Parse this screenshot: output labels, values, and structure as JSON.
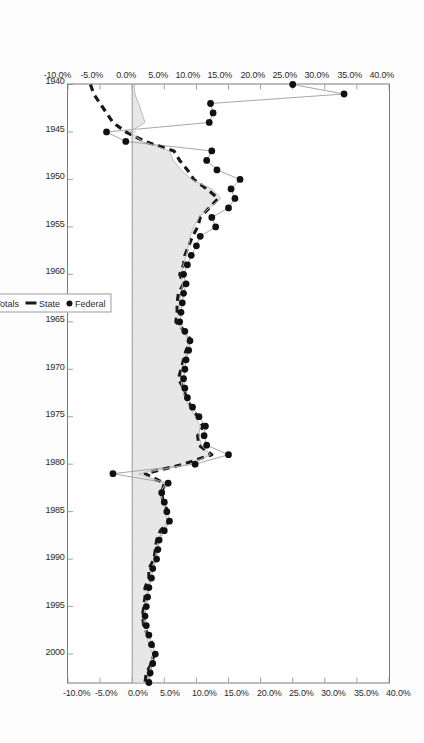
{
  "chart_data": {
    "type": "area",
    "title": "",
    "subtitle": "",
    "xlabel": "",
    "ylabel": "",
    "orientation": "rotated-90-clockwise",
    "grid": false,
    "legend_position": "right-of-plot",
    "xlim": [
      1940,
      2003
    ],
    "ylim": [
      -10.0,
      40.0
    ],
    "y_tick_labels": [
      "40.0%",
      "35.0%",
      "30.0%",
      "25.0%",
      "20.0%",
      "15.0%",
      "10.0%",
      "5.0%",
      "0.0%",
      "-5.0%",
      "-10.0%"
    ],
    "y_tick_values": [
      40.0,
      35.0,
      30.0,
      25.0,
      20.0,
      15.0,
      10.0,
      5.0,
      0.0,
      -5.0,
      -10.0
    ],
    "y_axis_duplicated": true,
    "x_tick_labels": [
      "1940",
      "1945",
      "1950",
      "1955",
      "1960",
      "1965",
      "1970",
      "1975",
      "1980",
      "1985",
      "1990",
      "1995",
      "2000"
    ],
    "x_tick_values": [
      1940,
      1945,
      1950,
      1955,
      1960,
      1965,
      1970,
      1975,
      1980,
      1985,
      1990,
      1995,
      2000
    ],
    "x": [
      1940,
      1941,
      1942,
      1943,
      1944,
      1945,
      1946,
      1947,
      1948,
      1949,
      1950,
      1951,
      1952,
      1953,
      1954,
      1955,
      1956,
      1957,
      1958,
      1959,
      1960,
      1961,
      1962,
      1963,
      1964,
      1965,
      1966,
      1967,
      1968,
      1969,
      1970,
      1971,
      1972,
      1973,
      1974,
      1975,
      1976,
      1977,
      1978,
      1979,
      1980,
      1981,
      1982,
      1983,
      1984,
      1985,
      1986,
      1987,
      1988,
      1989,
      1990,
      1991,
      1992,
      1993,
      1994,
      1995,
      1996,
      1997,
      1998,
      1999,
      2000,
      2001,
      2002,
      2003
    ],
    "series": [
      {
        "name": "Totals",
        "style": "filled-area-light-gray",
        "color": "#e6e6e6",
        "values": [
          0.3,
          0.4,
          1.0,
          1.5,
          2.0,
          -0.4,
          1.6,
          5.8,
          6.4,
          7.6,
          9.2,
          12.4,
          13.8,
          12.0,
          10.4,
          9.6,
          9.0,
          8.8,
          8.4,
          8.0,
          7.6,
          7.9,
          7.6,
          7.4,
          7.2,
          7.0,
          8.0,
          8.8,
          8.6,
          8.2,
          7.8,
          7.6,
          7.8,
          8.2,
          9.0,
          9.8,
          10.6,
          10.4,
          10.8,
          12.2,
          9.0,
          1.0,
          5.2,
          4.4,
          4.8,
          5.2,
          5.4,
          4.8,
          4.0,
          3.8,
          3.6,
          3.0,
          2.8,
          2.4,
          2.2,
          2.0,
          1.8,
          1.9,
          2.2,
          2.6,
          3.2,
          3.0,
          2.6,
          2.4
        ]
      },
      {
        "name": "State",
        "style": "dashed-line",
        "color": "#1a1a1a",
        "values": [
          -6.5,
          -6.0,
          -5.0,
          -4.0,
          -3.0,
          -1.0,
          2.0,
          6.5,
          7.4,
          8.6,
          9.6,
          11.6,
          13.4,
          12.0,
          10.6,
          10.2,
          9.4,
          8.8,
          8.2,
          8.0,
          7.4,
          8.0,
          7.2,
          7.0,
          7.0,
          6.8,
          8.2,
          9.2,
          8.4,
          8.0,
          7.6,
          7.2,
          8.0,
          8.4,
          9.2,
          10.2,
          11.0,
          10.2,
          10.4,
          12.4,
          8.0,
          2.0,
          5.0,
          4.6,
          4.8,
          5.6,
          5.8,
          4.4,
          3.8,
          3.6,
          3.4,
          2.6,
          2.6,
          2.0,
          2.0,
          1.8,
          1.6,
          1.8,
          2.4,
          3.2,
          3.4,
          3.0,
          2.2,
          2.0
        ]
      },
      {
        "name": "Federal",
        "style": "markers-dots-thin-line",
        "color": "#111111",
        "values": [
          25.0,
          33.0,
          12.2,
          12.6,
          12.0,
          -4.0,
          -1.0,
          12.4,
          11.6,
          13.2,
          16.8,
          15.4,
          16.0,
          15.0,
          12.4,
          13.0,
          10.6,
          10.0,
          9.2,
          8.6,
          8.0,
          8.4,
          8.0,
          7.8,
          7.6,
          7.4,
          8.2,
          9.0,
          8.8,
          8.4,
          8.2,
          8.0,
          8.2,
          8.6,
          9.4,
          10.4,
          11.4,
          11.2,
          11.6,
          15.0,
          9.8,
          -3.0,
          5.6,
          4.6,
          5.0,
          5.4,
          5.8,
          5.0,
          4.2,
          4.0,
          3.8,
          3.2,
          3.0,
          2.6,
          2.4,
          2.2,
          2.0,
          2.2,
          2.6,
          3.0,
          3.6,
          3.2,
          2.8,
          2.6
        ]
      }
    ]
  },
  "legend": {
    "items": [
      {
        "label": "Totals",
        "swatch": "area-swatch"
      },
      {
        "label": "State",
        "swatch": "dash-swatch"
      },
      {
        "label": "Federal",
        "swatch": "dot-swatch"
      }
    ]
  },
  "axes": {
    "y_top_labels": [
      "40.0%",
      "35.0%",
      "30.0%",
      "25.0%",
      "20.0%",
      "15.0%",
      "10.0%",
      "5.0%",
      "0.0%",
      "-5.0%",
      "-10.0%"
    ],
    "y_bottom_labels": [
      "40.0%",
      "35.0%",
      "30.0%",
      "25.0%",
      "20.0%",
      "15.0%",
      "10.0%",
      "5.0%",
      "0.0%",
      "-5.0%",
      "-10.0%"
    ],
    "x_labels": [
      "1940",
      "1945",
      "1950",
      "1955",
      "1960",
      "1965",
      "1970",
      "1975",
      "1980",
      "1985",
      "1990",
      "1995",
      "2000"
    ]
  },
  "colors": {
    "area_fill": "#e6e6e6",
    "line_dark": "#1a1a1a",
    "frame": "#7a7a7a",
    "text": "#2b2b2b",
    "background": "#fdfdfd"
  }
}
